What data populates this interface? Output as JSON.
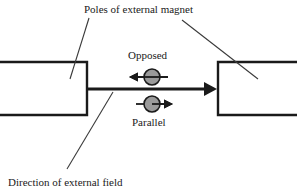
{
  "figure": {
    "title_label": "Poles of external magnet",
    "field_label": "Direction of external field",
    "opposed_label": "Opposed",
    "parallel_label": "Parallel",
    "colors": {
      "background": "#ffffff",
      "stroke": "#1a1a1a",
      "sphere_fill": "#9a9a9a",
      "sphere_stroke": "#1a1a1a",
      "leader": "#3a3a3a"
    },
    "elements": {
      "left_pole_name": "left magnet pole",
      "right_pole_name": "right magnet pole",
      "field_arrow_name": "external field arrow",
      "opposed_particle_name": "opposed spin particle",
      "parallel_particle_name": "parallel spin particle"
    }
  }
}
